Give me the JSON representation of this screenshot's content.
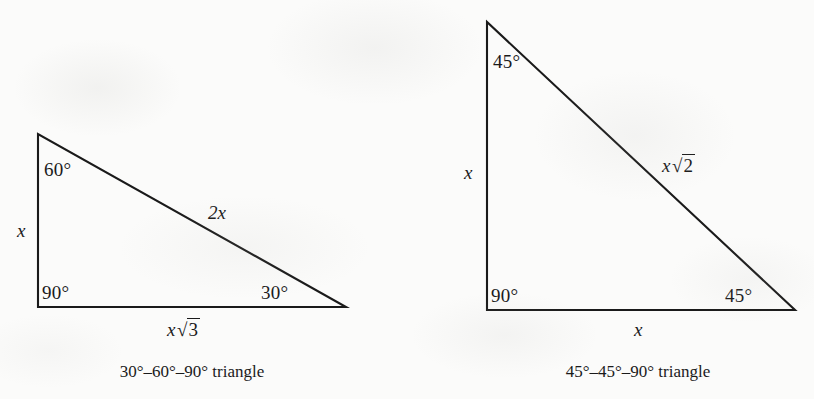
{
  "figure": {
    "background_color": "#fbfbfa",
    "ink_color": "#1a1a1a",
    "panels": [
      {
        "name": "30-60-90-triangle",
        "caption": "30°–60°–90° triangle",
        "vertices": {
          "apex": [
            38,
            134
          ],
          "right_angle": [
            38,
            307
          ],
          "base_right": [
            346,
            307
          ]
        },
        "angles": {
          "apex": "60°",
          "right_angle": "90°",
          "base_right": "30°"
        },
        "sides": {
          "vertical_leg": "x",
          "hypotenuse": "2x",
          "horizontal_leg_coefficient": "x",
          "horizontal_leg_radicand": "3"
        }
      },
      {
        "name": "45-45-90-triangle",
        "caption": "45°–45°–90° triangle",
        "vertices": {
          "apex": [
            487,
            22
          ],
          "right_angle": [
            487,
            310
          ],
          "base_right": [
            795,
            310
          ]
        },
        "angles": {
          "apex": "45°",
          "right_angle": "90°",
          "base_right": "45°"
        },
        "sides": {
          "vertical_leg": "x",
          "horizontal_leg": "x",
          "hypotenuse_coefficient": "x",
          "hypotenuse_radicand": "2"
        }
      }
    ]
  },
  "glyphs": {
    "radical_sign": "√"
  }
}
